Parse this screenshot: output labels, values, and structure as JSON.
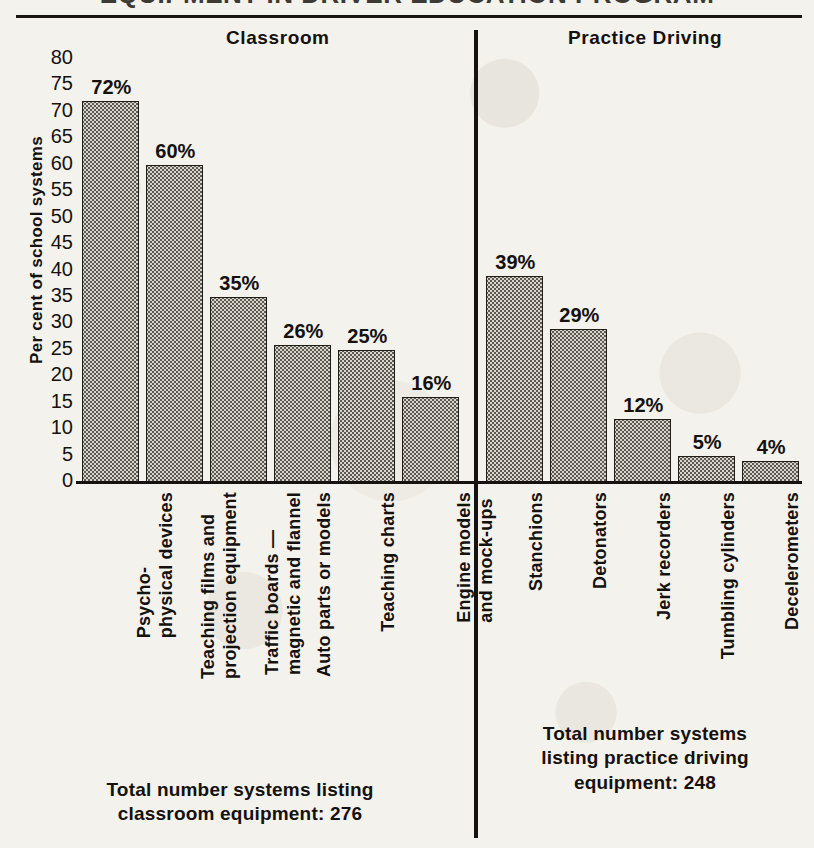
{
  "figure": {
    "title": "EQUIPMENT IN DRIVER EDUCATION PROGRAM",
    "top_rule": true
  },
  "sections": {
    "classroom_header": "Classroom",
    "practice_header": "Practice Driving"
  },
  "axis": {
    "y_label": "Per cent of school systems",
    "y_ticks": [
      "80",
      "75",
      "70",
      "65",
      "60",
      "55",
      "50",
      "45",
      "40",
      "35",
      "30",
      "25",
      "20",
      "15",
      "10",
      "5",
      "0"
    ],
    "y_min": 0,
    "y_max": 80
  },
  "footnotes": {
    "classroom": "Total number systems listing classroom equipment: 276",
    "classroom_line1": "Total number systems listing",
    "classroom_line2": "classroom equipment: 276",
    "practice": "Total number systems listing practice driving equipment: 248",
    "practice_line1": "Total number systems",
    "practice_line2": "listing practice driving",
    "practice_line3": "equipment: 248"
  },
  "colors": {
    "ink": "#14110f",
    "bar_fill": "#d8d5cd",
    "bar_stipple": "#5d5952",
    "paper": "#f4f2ec"
  },
  "chart_data": {
    "type": "bar",
    "title": "EQUIPMENT IN DRIVER EDUCATION PROGRAM",
    "xlabel": "",
    "ylabel": "Per cent of school systems",
    "ylim": [
      0,
      80
    ],
    "ytick_step": 5,
    "grid": false,
    "legend": "none",
    "value_label_suffix": "%",
    "groups": [
      {
        "name": "Classroom",
        "total_systems": 276,
        "categories": [
          "Psycho-physical devices",
          "Teaching films and projection equipment",
          "Traffic boards — magnetic and flannel",
          "Auto parts or models",
          "Teaching charts",
          "Engine models and mock-ups"
        ],
        "values": [
          72,
          60,
          35,
          26,
          25,
          16
        ],
        "value_labels": [
          "72%",
          "60%",
          "35%",
          "26%",
          "25%",
          "16%"
        ],
        "category_lines": [
          [
            "Psycho-",
            "physical devices"
          ],
          [
            "Teaching films and",
            "projection equipment"
          ],
          [
            "Traffic boards —",
            "magnetic and flannel"
          ],
          [
            "Auto parts or models",
            ""
          ],
          [
            "Teaching charts",
            ""
          ],
          [
            "Engine models",
            "and mock-ups"
          ]
        ]
      },
      {
        "name": "Practice Driving",
        "total_systems": 248,
        "categories": [
          "Stanchions",
          "Detonators",
          "Jerk recorders",
          "Tumbling cylinders",
          "Decelerometers"
        ],
        "values": [
          39,
          29,
          12,
          5,
          4
        ],
        "value_labels": [
          "39%",
          "29%",
          "12%",
          "5%",
          "4%"
        ],
        "category_lines": [
          [
            "Stanchions",
            ""
          ],
          [
            "Detonators",
            ""
          ],
          [
            "Jerk recorders",
            ""
          ],
          [
            "Tumbling cylinders",
            ""
          ],
          [
            "Decelerometers",
            ""
          ]
        ]
      }
    ]
  }
}
